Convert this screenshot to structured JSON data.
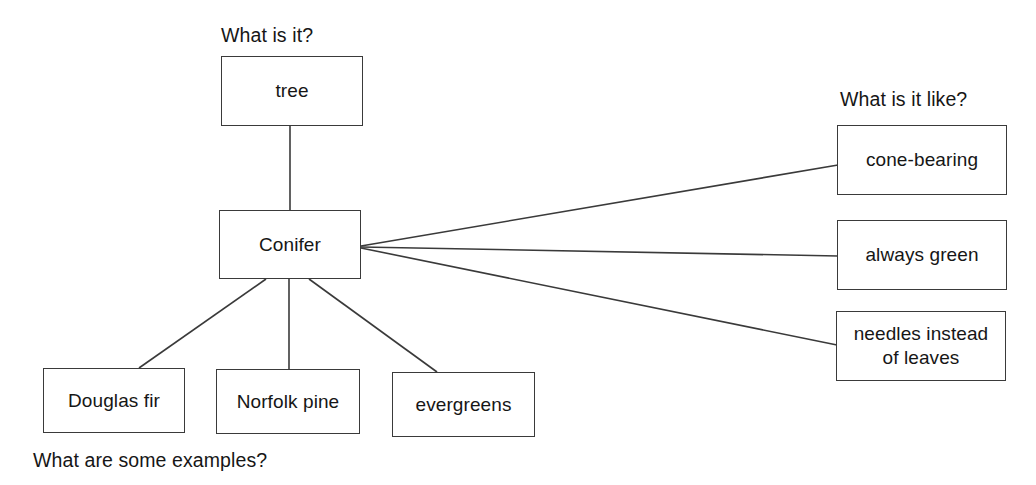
{
  "diagram": {
    "type": "concept-map",
    "topic": "Conifer",
    "background_color": "#ffffff",
    "line_color": "#3a3a3a",
    "text_color": "#161616"
  },
  "captions": {
    "what_is_it": "What is it?",
    "what_is_it_like": "What is it like?",
    "what_are_some_examples": "What are some examples?"
  },
  "nodes": {
    "center": {
      "label": "Conifer"
    },
    "category": {
      "label": "tree"
    },
    "attributes": [
      {
        "label": "cone-bearing"
      },
      {
        "label": "always green"
      },
      {
        "label": "needles instead\nof leaves"
      }
    ],
    "examples": [
      {
        "label": "Douglas fir"
      },
      {
        "label": "Norfolk pine"
      },
      {
        "label": "evergreens"
      }
    ]
  },
  "connectors": [
    {
      "name": "conifer-to-tree",
      "from": "Conifer",
      "to": "tree",
      "x1": 290,
      "y1": 210,
      "x2": 290,
      "y2": 126
    },
    {
      "name": "conifer-to-cone",
      "from": "Conifer",
      "to": "cone-bearing",
      "x1": 361,
      "y1": 246,
      "x2": 838,
      "y2": 165
    },
    {
      "name": "conifer-to-green",
      "from": "Conifer",
      "to": "always green",
      "x1": 361,
      "y1": 247,
      "x2": 838,
      "y2": 256
    },
    {
      "name": "conifer-to-needles",
      "from": "Conifer",
      "to": "needles instead of leaves",
      "x1": 361,
      "y1": 248,
      "x2": 837,
      "y2": 345
    },
    {
      "name": "conifer-to-douglas",
      "from": "Conifer",
      "to": "Douglas fir",
      "x1": 266,
      "y1": 279,
      "x2": 139,
      "y2": 368
    },
    {
      "name": "conifer-to-norfolk",
      "from": "Conifer",
      "to": "Norfolk pine",
      "x1": 289,
      "y1": 279,
      "x2": 289,
      "y2": 369
    },
    {
      "name": "conifer-to-evergreens",
      "from": "Conifer",
      "to": "evergreens",
      "x1": 309,
      "y1": 279,
      "x2": 437,
      "y2": 372
    }
  ]
}
